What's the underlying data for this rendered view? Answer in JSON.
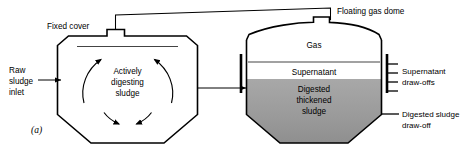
{
  "figure": {
    "panel_letter": "(a)",
    "background_color": "#ffffff",
    "line_color": "#000000",
    "sludge_fill_color": "#9e9e9e",
    "supernatant_fill_color": "#ffffff",
    "gas_fill_color": "#ffffff"
  },
  "labels": {
    "fixed_cover": "Fixed cover",
    "floating_gas_dome": "Floating gas dome",
    "raw_sludge_inlet_line1": "Raw",
    "raw_sludge_inlet_line2": "sludge",
    "raw_sludge_inlet_line3": "inlet",
    "actively_digesting_line1": "Actively",
    "actively_digesting_line2": "digesting",
    "actively_digesting_line3": "sludge",
    "gas": "Gas",
    "supernatant": "Supernatant",
    "digested_thickened_line1": "Digested",
    "digested_thickened_line2": "thickened",
    "digested_thickened_line3": "sludge",
    "supernatant_drawoffs_line1": "Supernatant",
    "supernatant_drawoffs_line2": "draw-offs",
    "digested_sludge_drawoff_line1": "Digested sludge",
    "digested_sludge_drawoff_line2": "draw-off"
  },
  "icons": {
    "inlet_arrow": "right-arrow-icon",
    "transfer_arrow": "right-arrow-icon",
    "circulation_top_left_arrow": "curved-arrow-icon",
    "circulation_top_right_arrow": "curved-arrow-icon",
    "circulation_bottom_left_arrow": "curved-arrow-icon",
    "circulation_bottom_right_arrow": "curved-arrow-icon"
  },
  "drawoffs": {
    "supernatant_tick_count": 4,
    "digested_sludge_tick_count": 1
  }
}
